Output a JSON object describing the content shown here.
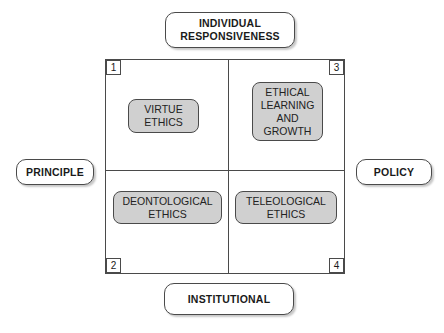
{
  "axes": {
    "top": [
      "INDIVIDUAL",
      "RESPONSIVENESS"
    ],
    "bottom": "INSTITUTIONAL",
    "left": "PRINCIPLE",
    "right": "POLICY"
  },
  "quadrants": [
    {
      "number": "1",
      "position": "top-left",
      "label": [
        "VIRTUE",
        "ETHICS"
      ]
    },
    {
      "number": "2",
      "position": "bottom-left",
      "label": [
        "DEONTOLOGICAL",
        "ETHICS"
      ]
    },
    {
      "number": "3",
      "position": "top-right",
      "label": [
        "ETHICAL",
        "LEARNING",
        "AND",
        "GROWTH"
      ]
    },
    {
      "number": "4",
      "position": "bottom-right",
      "label": [
        "TELEOLOGICAL",
        "ETHICS"
      ]
    }
  ],
  "colors": {
    "quadrant_fill": "#d0d0d0",
    "border": "#4a4a4a",
    "background": "#ffffff"
  }
}
